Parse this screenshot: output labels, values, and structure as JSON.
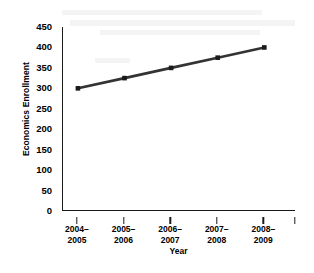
{
  "chart_data": {
    "type": "line",
    "title": "",
    "xlabel": "Year",
    "ylabel": "Economics Enrollment",
    "categories": [
      "2004–2005",
      "2005–2006",
      "2006–2007",
      "2007–2008",
      "2008–2009"
    ],
    "category_lines": [
      [
        "2004–",
        "2005"
      ],
      [
        "2005–",
        "2006"
      ],
      [
        "2006–",
        "2007"
      ],
      [
        "2007–",
        "2008"
      ],
      [
        "2008–",
        "2009"
      ]
    ],
    "values": [
      300,
      325,
      350,
      375,
      400
    ],
    "series": [
      {
        "name": "Economics Enrollment",
        "values": [
          300,
          325,
          350,
          375,
          400
        ]
      }
    ],
    "ylim": [
      0,
      450
    ],
    "ytick_values": [
      0,
      50,
      100,
      150,
      200,
      250,
      300,
      350,
      400,
      450
    ],
    "ytick_labels": [
      "0",
      "50",
      "100",
      "150",
      "200",
      "250",
      "300",
      "350",
      "400",
      "450"
    ],
    "ytick_step": 50,
    "grid": false,
    "legend": false,
    "legend_position": "none",
    "marker": "square",
    "line_color": "#333333",
    "marker_color": "#1a1a1a",
    "background_color": "#ffffff",
    "axis_color": "#1a1a1a",
    "spines": [
      "left",
      "bottom"
    ],
    "tick_direction": "in",
    "annotations": []
  }
}
